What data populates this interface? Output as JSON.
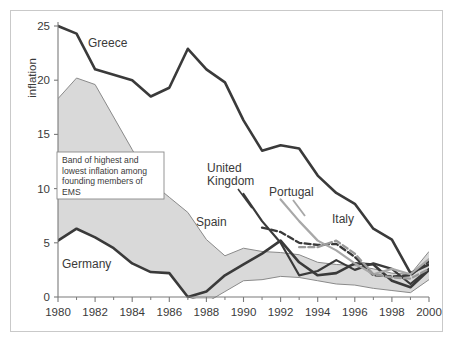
{
  "chart_data": {
    "type": "line",
    "title": "",
    "xlabel": "",
    "ylabel": "inflation",
    "xlim": [
      1980,
      2000
    ],
    "ylim": [
      -1,
      25
    ],
    "grid": false,
    "legend_position": "inline-labels",
    "x_tick_labels": [
      "1980",
      "1982",
      "1984",
      "1986",
      "1988",
      "1990",
      "1992",
      "1994",
      "1996",
      "1998",
      "2000"
    ],
    "x_ticks": [
      1980,
      1982,
      1984,
      1986,
      1988,
      1990,
      1992,
      1994,
      1996,
      1998,
      2000
    ],
    "x_minor_ticks": [
      1981,
      1983,
      1985,
      1987,
      1989,
      1991,
      1993,
      1995,
      1997,
      1999
    ],
    "y_tick_labels": [
      "0",
      "5",
      "10",
      "15",
      "20",
      "25"
    ],
    "y_ticks": [
      0,
      5,
      10,
      15,
      20,
      25
    ],
    "annotation": {
      "text": "Band of highest and lowest inflation among founding members of EMS",
      "lines": [
        "Band of highest and",
        "lowest inflation among",
        "founding members of",
        "EMS"
      ]
    },
    "band": {
      "name": "Band of highest and lowest inflation among founding members of EMS",
      "fill_color": "#d9d9d9",
      "edge_color": "#8a8a8a",
      "x": [
        1980,
        1981,
        1982,
        1983,
        1984,
        1985,
        1986,
        1987,
        1988,
        1989,
        1990,
        1991,
        1992,
        1993,
        1994,
        1995,
        1996,
        1997,
        1998,
        1999,
        2000
      ],
      "upper": [
        18.3,
        20.2,
        19.6,
        16.6,
        13.6,
        10.6,
        9.2,
        7.8,
        5.3,
        3.8,
        4.5,
        4.2,
        4.1,
        3.9,
        3.2,
        3.0,
        2.9,
        2.6,
        2.2,
        2.1,
        4.2
      ],
      "lower": [
        5.2,
        6.3,
        5.5,
        4.5,
        3.1,
        2.3,
        2.2,
        0.0,
        -0.5,
        0.5,
        1.5,
        1.6,
        1.9,
        1.8,
        1.5,
        1.2,
        1.1,
        0.8,
        0.6,
        0.4,
        1.6
      ]
    },
    "series": [
      {
        "name": "Greece",
        "style": "solid",
        "color": "#3a3a3a",
        "width": 2.6,
        "x": [
          1980,
          1981,
          1982,
          1983,
          1984,
          1985,
          1986,
          1987,
          1988,
          1989,
          1990,
          1991,
          1992,
          1993,
          1994,
          1995,
          1996,
          1997,
          1998,
          1999,
          2000
        ],
        "values": [
          25.0,
          24.3,
          21.0,
          20.5,
          20.0,
          18.5,
          19.3,
          22.9,
          21.0,
          19.8,
          16.3,
          13.5,
          14.0,
          13.7,
          11.2,
          9.6,
          8.6,
          6.3,
          5.3,
          2.2,
          3.0
        ]
      },
      {
        "name": "Germany",
        "style": "solid",
        "color": "#3a3a3a",
        "width": 2.6,
        "x": [
          1980,
          1981,
          1982,
          1983,
          1984,
          1985,
          1986,
          1987,
          1988,
          1989,
          1990,
          1991,
          1992,
          1993,
          1994,
          1995,
          1996,
          1997,
          1998,
          1999,
          2000
        ],
        "values": [
          5.2,
          6.3,
          5.5,
          4.5,
          3.1,
          2.3,
          2.2,
          0.0,
          0.5,
          2.0,
          3.0,
          4.0,
          5.2,
          3.2,
          2.0,
          2.2,
          3.1,
          3.0,
          1.5,
          0.9,
          2.5
        ]
      },
      {
        "name": "United Kingdom",
        "style": "solid",
        "color": "#3a3a3a",
        "width": 2.2,
        "x": [
          1990,
          1991,
          1992,
          1993,
          1994,
          1995,
          1996,
          1997,
          1998,
          1999,
          2000
        ],
        "values": [
          9.5,
          7.0,
          5.0,
          2.0,
          2.4,
          3.4,
          2.5,
          3.1,
          2.6,
          1.2,
          2.6
        ]
      },
      {
        "name": "Spain",
        "style": "dashed",
        "color": "#3a3a3a",
        "width": 2.3,
        "x": [
          1991,
          1992,
          1993,
          1994,
          1995,
          1996,
          1997,
          1998,
          1999,
          2000
        ],
        "values": [
          6.4,
          6.0,
          5.0,
          4.8,
          4.9,
          3.7,
          2.0,
          1.9,
          2.0,
          3.3
        ]
      },
      {
        "name": "Portugal",
        "style": "solid",
        "color": "#a8a8a8",
        "width": 2.2,
        "x": [
          1992,
          1993,
          1994,
          1995,
          1996,
          1997,
          1998,
          1999,
          2000
        ],
        "values": [
          9.0,
          7.0,
          5.2,
          4.3,
          3.1,
          2.1,
          2.6,
          2.1,
          3.5
        ]
      },
      {
        "name": "Italy",
        "style": "dashed",
        "color": "#9a9a9a",
        "width": 2.3,
        "x": [
          1993,
          1994,
          1995,
          1996,
          1997,
          1998,
          1999,
          2000
        ],
        "values": [
          4.6,
          4.6,
          5.2,
          4.0,
          2.1,
          1.8,
          1.7,
          2.6
        ]
      }
    ],
    "series_labels": [
      {
        "name": "Greece",
        "text": "Greece",
        "x": 104,
        "y": 45
      },
      {
        "name": "Germany",
        "text": "Germany",
        "x": 62,
        "y": 264
      },
      {
        "name": "United Kingdom",
        "text_line1": "United Kingdom",
        "x": 210,
        "y": 168
      },
      {
        "name": "Spain",
        "text": "Spain",
        "x": 198,
        "y": 222
      },
      {
        "name": "Portugal",
        "text": "Portugal",
        "x": 272,
        "y": 191
      },
      {
        "name": "Italy",
        "text": "Italy",
        "x": 335,
        "y": 219
      }
    ]
  },
  "labels": {
    "greece": "Greece",
    "germany": "Germany",
    "uk_line1": "United",
    "uk_line2": "Kingdom",
    "spain": "Spain",
    "portugal": "Portugal",
    "italy": "Italy",
    "y_axis": "inflation",
    "ann_l1": "Band of highest and",
    "ann_l2": "lowest inflation among",
    "ann_l3": "founding members of",
    "ann_l4": "EMS",
    "x0": "1980",
    "x1": "1982",
    "x2": "1984",
    "x3": "1986",
    "x4": "1988",
    "x5": "1990",
    "x6": "1992",
    "x7": "1994",
    "x8": "1996",
    "x9": "1998",
    "x10": "2000",
    "y0": "0",
    "y1": "5",
    "y2": "10",
    "y3": "15",
    "y4": "20",
    "y5": "25"
  }
}
